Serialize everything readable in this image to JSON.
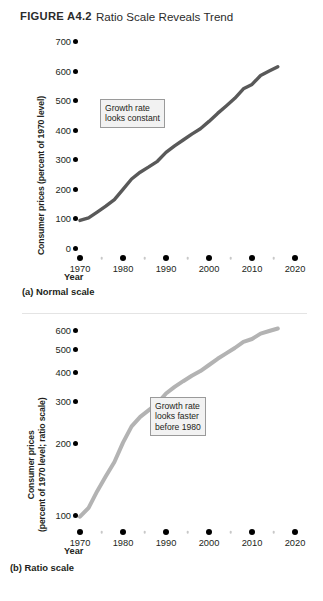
{
  "figure": {
    "number": "FIGURE A4.2",
    "title": "Ratio Scale Reveals Trend"
  },
  "panels": [
    {
      "id": "a",
      "caption": "(a) Normal scale",
      "yaxis_title": "Consumer prices (percent of 1970 level)",
      "xaxis_title": "Year",
      "annotation": "Growth rate\nlooks constant",
      "line_color": "#595959"
    },
    {
      "id": "b",
      "caption": "(b) Ratio scale",
      "yaxis_title_line1": "Consumer prices",
      "yaxis_title_line2": "(percent of 1970 level; ratio scale)",
      "xaxis_title": "Year",
      "annotation": "Growth rate\nlooks faster\nbefore 1980",
      "line_color": "#b3b3b3"
    }
  ],
  "chart_data": [
    {
      "type": "line",
      "title": "(a) Normal scale",
      "xlabel": "Year",
      "ylabel": "Consumer prices (percent of 1970 level)",
      "scale": "linear",
      "xlim": [
        1970,
        2020
      ],
      "ylim": [
        0,
        700
      ],
      "yticks": [
        0,
        100,
        200,
        300,
        400,
        500,
        600,
        700
      ],
      "xticks": [
        1970,
        1980,
        1990,
        2000,
        2010,
        2020
      ],
      "xminorticks": [
        1975,
        1985,
        1995,
        2005,
        2015
      ],
      "grid": false,
      "legend": false,
      "annotations": [
        "Growth rate looks constant"
      ],
      "x": [
        1970,
        1972,
        1974,
        1976,
        1978,
        1980,
        1982,
        1984,
        1986,
        1988,
        1990,
        1992,
        1994,
        1996,
        1998,
        2000,
        2002,
        2004,
        2006,
        2008,
        2010,
        2012,
        2014,
        2016
      ],
      "values": [
        100,
        109,
        128,
        148,
        170,
        205,
        240,
        263,
        281,
        300,
        330,
        352,
        372,
        392,
        410,
        435,
        462,
        487,
        513,
        545,
        560,
        590,
        605,
        620
      ]
    },
    {
      "type": "line",
      "title": "(b) Ratio scale",
      "xlabel": "Year",
      "ylabel": "Consumer prices (percent of 1970 level; ratio scale)",
      "scale": "log",
      "xlim": [
        1970,
        2020
      ],
      "ylim": [
        95,
        660
      ],
      "yticks": [
        100,
        200,
        300,
        400,
        500,
        600
      ],
      "xticks": [
        1970,
        1980,
        1990,
        2000,
        2010,
        2020
      ],
      "xminorticks": [
        1975,
        1985,
        1995,
        2005,
        2015
      ],
      "grid": false,
      "legend": false,
      "annotations": [
        "Growth rate looks faster before 1980"
      ],
      "x": [
        1970,
        1972,
        1974,
        1976,
        1978,
        1980,
        1982,
        1984,
        1986,
        1988,
        1990,
        1992,
        1994,
        1996,
        1998,
        2000,
        2002,
        2004,
        2006,
        2008,
        2010,
        2012,
        2014,
        2016
      ],
      "values": [
        100,
        109,
        128,
        148,
        170,
        205,
        240,
        263,
        281,
        300,
        330,
        352,
        372,
        392,
        410,
        435,
        462,
        487,
        513,
        545,
        560,
        590,
        605,
        620
      ]
    }
  ]
}
